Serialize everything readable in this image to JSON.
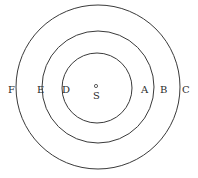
{
  "diagram": {
    "center": {
      "label": "S",
      "x": 98,
      "y": 87
    },
    "circles": [
      {
        "name": "inner",
        "r": 35,
        "left_label": "D",
        "right_label": "A"
      },
      {
        "name": "middle",
        "r": 56,
        "left_label": "E",
        "right_label": "B"
      },
      {
        "name": "outer",
        "r": 82,
        "left_label": "F",
        "right_label": "C"
      }
    ],
    "colors": {
      "stroke": "#3a3a3a",
      "text": "#2a2a2a",
      "background": "#ffffff"
    }
  }
}
